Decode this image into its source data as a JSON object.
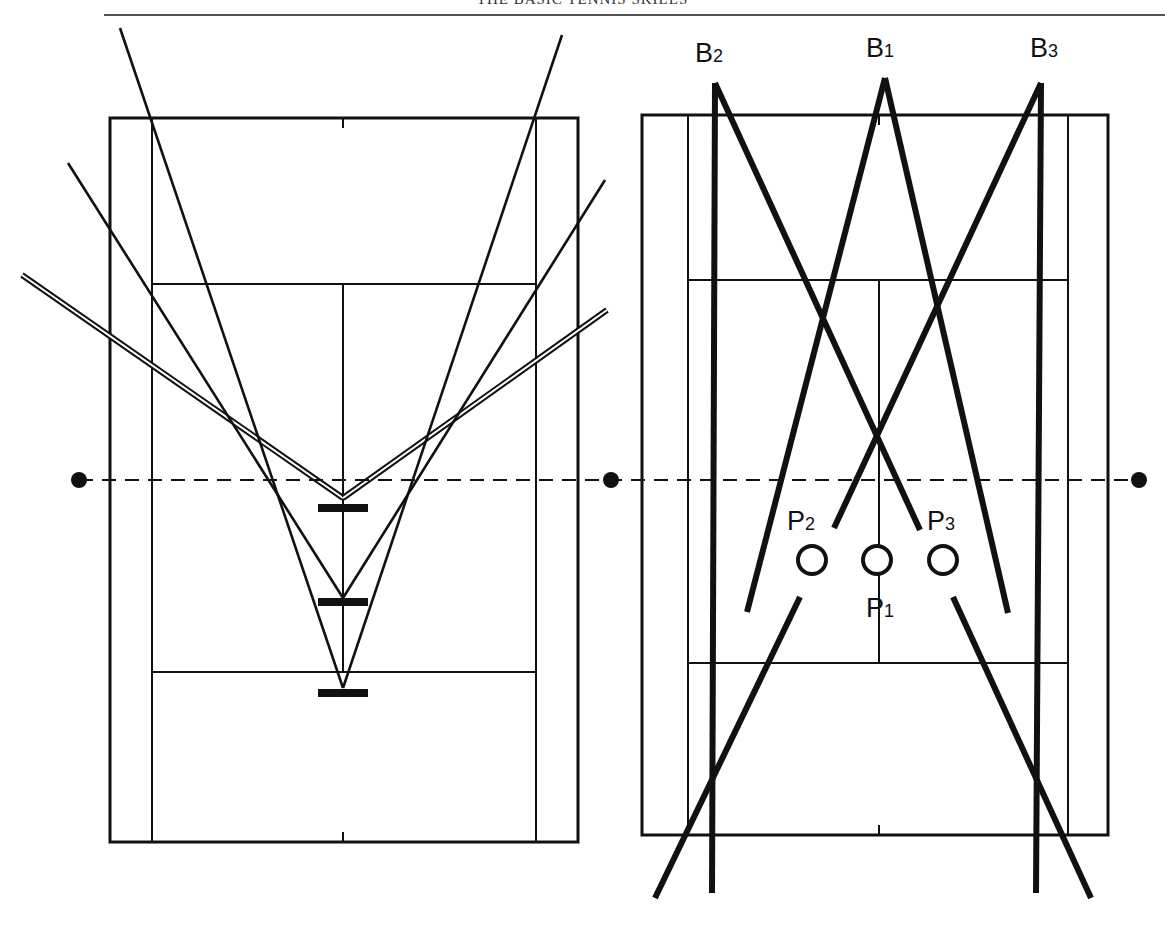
{
  "header": {
    "running_head": "THE BASIC TENNIS SKILLS"
  },
  "colors": {
    "ink": "#111111",
    "paper": "#ffffff",
    "rule": "#555555"
  },
  "left_court": {
    "outer": {
      "x": 110,
      "y": 118,
      "w": 468,
      "h": 724
    },
    "singles_left_x": 152,
    "singles_right_x": 536,
    "service_line_top_y": 284,
    "service_line_bottom_y": 672,
    "center_x": 343,
    "net_y": 480,
    "player_positions": [
      {
        "id": "pos-near-net",
        "x": 343,
        "y": 508
      },
      {
        "id": "pos-mid",
        "x": 343,
        "y": 602
      },
      {
        "id": "pos-baseline",
        "x": 343,
        "y": 693
      }
    ],
    "angle_lines": [
      {
        "name": "wide-angle-double-left",
        "x1": 22,
        "y1": 275,
        "x2": 343,
        "y2": 498,
        "style": "double"
      },
      {
        "name": "wide-angle-double-right",
        "x1": 607,
        "y1": 310,
        "x2": 343,
        "y2": 498,
        "style": "double"
      },
      {
        "name": "mid-angle-left",
        "x1": 68,
        "y1": 163,
        "x2": 343,
        "y2": 598,
        "style": "single"
      },
      {
        "name": "mid-angle-right",
        "x1": 605,
        "y1": 180,
        "x2": 343,
        "y2": 598,
        "style": "single"
      },
      {
        "name": "narrow-angle-left",
        "x1": 120,
        "y1": 28,
        "x2": 343,
        "y2": 688,
        "style": "single"
      },
      {
        "name": "narrow-angle-right",
        "x1": 562,
        "y1": 35,
        "x2": 343,
        "y2": 688,
        "style": "single"
      }
    ]
  },
  "right_court": {
    "outer": {
      "x": 642,
      "y": 115,
      "w": 466,
      "h": 720
    },
    "singles_left_x": 688,
    "singles_right_x": 1068,
    "service_line_top_y": 280,
    "service_line_bottom_y": 663,
    "center_x": 879,
    "ball_labels": [
      {
        "name": "B",
        "sub": "2",
        "x": 695,
        "y": 62
      },
      {
        "name": "B",
        "sub": "1",
        "x": 866,
        "y": 57
      },
      {
        "name": "B",
        "sub": "3",
        "x": 1030,
        "y": 57
      }
    ],
    "player_labels": [
      {
        "name": "P",
        "sub": "2",
        "x": 787,
        "y": 530
      },
      {
        "name": "P",
        "sub": "3",
        "x": 927,
        "y": 530
      },
      {
        "name": "P",
        "sub": "1",
        "x": 866,
        "y": 617
      }
    ],
    "players": [
      {
        "id": "P2",
        "cx": 812,
        "cy": 560
      },
      {
        "id": "P1",
        "cx": 877,
        "cy": 560
      },
      {
        "id": "P3",
        "cx": 943,
        "cy": 560
      }
    ],
    "shot_lines": [
      {
        "name": "B2-straight",
        "x1": 715,
        "y1": 83,
        "x2": 712,
        "y2": 893
      },
      {
        "name": "B3-straight",
        "x1": 1041,
        "y1": 83,
        "x2": 1036,
        "y2": 893
      },
      {
        "name": "B2-cross",
        "x1": 715,
        "y1": 83,
        "x2": 920,
        "y2": 530
      },
      {
        "name": "B3-cross",
        "x1": 1041,
        "y1": 83,
        "x2": 834,
        "y2": 528
      },
      {
        "name": "B1-left",
        "x1": 885,
        "y1": 78,
        "x2": 747,
        "y2": 612
      },
      {
        "name": "B1-right",
        "x1": 885,
        "y1": 78,
        "x2": 1008,
        "y2": 613
      },
      {
        "name": "B2-cross-continued",
        "x1": 800,
        "y1": 597,
        "x2": 655,
        "y2": 898
      },
      {
        "name": "B3-cross-continued",
        "x1": 953,
        "y1": 597,
        "x2": 1091,
        "y2": 898
      }
    ]
  },
  "net_line": {
    "y": 480,
    "x1": 79,
    "x2": 1139,
    "posts": [
      {
        "x": 79
      },
      {
        "x": 611
      },
      {
        "x": 1139
      }
    ]
  }
}
